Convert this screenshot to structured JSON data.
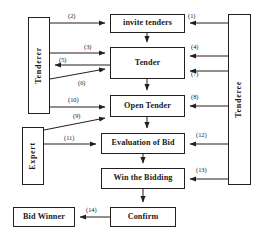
{
  "diagram": {
    "colors": {
      "line": "#231f20",
      "text": "#1a1a1a",
      "background": "#ffffff"
    },
    "actors": [
      {
        "id": "tenderer",
        "label": "Tenderer",
        "x": 28,
        "y": 17,
        "w": 22,
        "h": 97
      },
      {
        "id": "tenderee",
        "label": "Tenderee",
        "x": 228,
        "y": 14,
        "w": 23,
        "h": 171
      },
      {
        "id": "expert",
        "label": "Expert",
        "x": 22,
        "y": 127,
        "w": 22,
        "h": 58
      }
    ],
    "processes": [
      {
        "id": "invite-tenders",
        "label": "invite tenders",
        "x": 110,
        "y": 14,
        "w": 75,
        "h": 19
      },
      {
        "id": "tender",
        "label": "Tender",
        "x": 110,
        "y": 47,
        "w": 75,
        "h": 32
      },
      {
        "id": "open-tender",
        "label": "Open Tender",
        "x": 110,
        "y": 95,
        "w": 75,
        "h": 22
      },
      {
        "id": "evaluation-of-bid",
        "label": "Evaluation of Bid",
        "x": 101,
        "y": 133,
        "w": 84,
        "h": 21
      },
      {
        "id": "win-the-bidding",
        "label": "Win the Bidding",
        "x": 101,
        "y": 168,
        "w": 84,
        "h": 21
      },
      {
        "id": "confirm",
        "label": "Confirm",
        "x": 110,
        "y": 207,
        "w": 66,
        "h": 20
      },
      {
        "id": "bid-winner",
        "label": "Bid Winner",
        "x": 13,
        "y": 207,
        "w": 62,
        "h": 20
      }
    ],
    "edges": [
      {
        "id": "e1",
        "label": "(1)",
        "from": "tenderee",
        "to": "invite-tenders",
        "lx": 188,
        "ly": 12
      },
      {
        "id": "e2",
        "label": "(2)",
        "from": "tenderer",
        "to": "invite-tenders",
        "lx": 68,
        "ly": 12
      },
      {
        "id": "e3",
        "label": "(3)",
        "from": "tenderer",
        "to": "tender",
        "lx": 84,
        "ly": 43
      },
      {
        "id": "e4",
        "label": "(4)",
        "from": "tenderee",
        "to": "tender",
        "lx": 191,
        "ly": 43
      },
      {
        "id": "e5",
        "label": "(5)",
        "from": "tender",
        "to": "tenderer",
        "lx": 59,
        "ly": 56
      },
      {
        "id": "e6",
        "label": "(6)",
        "from": "tenderer",
        "to": "tender",
        "lx": 78,
        "ly": 79
      },
      {
        "id": "e7",
        "label": "(7)",
        "from": "tenderee",
        "to": "tender",
        "lx": 191,
        "ly": 70
      },
      {
        "id": "e8",
        "label": "(8)",
        "from": "tenderee",
        "to": "open-tender",
        "lx": 191,
        "ly": 93
      },
      {
        "id": "e9",
        "label": "(9)",
        "from": "expert",
        "to": "open-tender",
        "lx": 73,
        "ly": 112
      },
      {
        "id": "e10",
        "label": "(10)",
        "from": "tenderer",
        "to": "open-tender",
        "lx": 68,
        "ly": 96
      },
      {
        "id": "e11",
        "label": "(11)",
        "from": "expert",
        "to": "evaluation-of-bid",
        "lx": 64,
        "ly": 134
      },
      {
        "id": "e12",
        "label": "(12)",
        "from": "tenderee",
        "to": "evaluation-of-bid",
        "lx": 196,
        "ly": 131
      },
      {
        "id": "e13",
        "label": "(13)",
        "from": "tenderee",
        "to": "win-the-bidding",
        "lx": 196,
        "ly": 166
      },
      {
        "id": "e14",
        "label": "(14)",
        "from": "confirm",
        "to": "bid-winner",
        "lx": 86,
        "ly": 206
      }
    ],
    "flow_chain": [
      "invite-tenders",
      "tender",
      "open-tender",
      "evaluation-of-bid",
      "win-the-bidding",
      "confirm"
    ]
  }
}
